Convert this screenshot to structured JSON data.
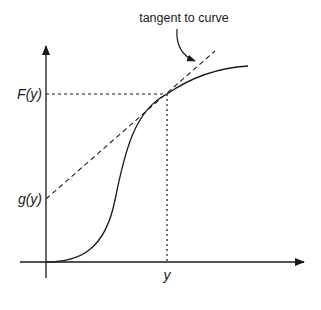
{
  "diagram": {
    "annotation": "tangent to curve",
    "y_axis_labels": {
      "upper": "F(y)",
      "lower": "g(y)"
    },
    "x_axis_label": "y",
    "colors": {
      "ink": "#1a1a1a",
      "background": "#ffffff"
    }
  }
}
